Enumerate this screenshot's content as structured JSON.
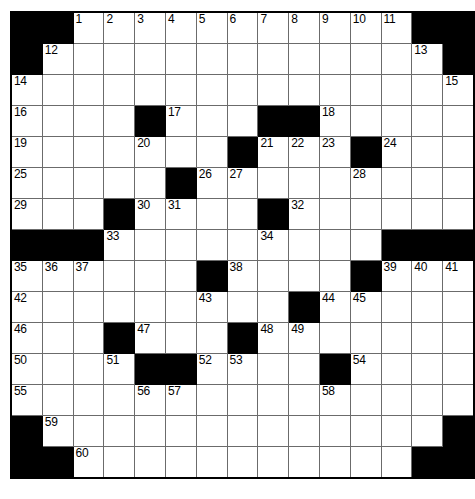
{
  "puzzle": {
    "title": "",
    "rows": 15,
    "cols": 15,
    "cell_size_px": 30,
    "colors": {
      "block": "#000000",
      "cell": "#ffffff",
      "grid_line": "#6b6b6b",
      "border": "#000000",
      "number_text": "#000000"
    },
    "grid": [
      [
        {
          "type": "block"
        },
        {
          "type": "block"
        },
        {
          "type": "cell",
          "number": "1"
        },
        {
          "type": "cell",
          "number": "2"
        },
        {
          "type": "cell",
          "number": "3"
        },
        {
          "type": "cell",
          "number": "4"
        },
        {
          "type": "cell",
          "number": "5"
        },
        {
          "type": "cell",
          "number": "6"
        },
        {
          "type": "cell",
          "number": "7"
        },
        {
          "type": "cell",
          "number": "8"
        },
        {
          "type": "cell",
          "number": "9"
        },
        {
          "type": "cell",
          "number": "10"
        },
        {
          "type": "cell",
          "number": "11"
        },
        {
          "type": "block"
        },
        {
          "type": "block"
        }
      ],
      [
        {
          "type": "block"
        },
        {
          "type": "cell",
          "number": "12"
        },
        {
          "type": "cell",
          "number": ""
        },
        {
          "type": "cell",
          "number": ""
        },
        {
          "type": "cell",
          "number": ""
        },
        {
          "type": "cell",
          "number": ""
        },
        {
          "type": "cell",
          "number": ""
        },
        {
          "type": "cell",
          "number": ""
        },
        {
          "type": "cell",
          "number": ""
        },
        {
          "type": "cell",
          "number": ""
        },
        {
          "type": "cell",
          "number": ""
        },
        {
          "type": "cell",
          "number": ""
        },
        {
          "type": "cell",
          "number": ""
        },
        {
          "type": "cell",
          "number": "13"
        },
        {
          "type": "block"
        }
      ],
      [
        {
          "type": "cell",
          "number": "14"
        },
        {
          "type": "cell",
          "number": ""
        },
        {
          "type": "cell",
          "number": ""
        },
        {
          "type": "cell",
          "number": ""
        },
        {
          "type": "cell",
          "number": ""
        },
        {
          "type": "cell",
          "number": ""
        },
        {
          "type": "cell",
          "number": ""
        },
        {
          "type": "cell",
          "number": ""
        },
        {
          "type": "cell",
          "number": ""
        },
        {
          "type": "cell",
          "number": ""
        },
        {
          "type": "cell",
          "number": ""
        },
        {
          "type": "cell",
          "number": ""
        },
        {
          "type": "cell",
          "number": ""
        },
        {
          "type": "cell",
          "number": ""
        },
        {
          "type": "cell",
          "number": "15"
        }
      ],
      [
        {
          "type": "cell",
          "number": "16"
        },
        {
          "type": "cell",
          "number": ""
        },
        {
          "type": "cell",
          "number": ""
        },
        {
          "type": "cell",
          "number": ""
        },
        {
          "type": "block"
        },
        {
          "type": "cell",
          "number": "17"
        },
        {
          "type": "cell",
          "number": ""
        },
        {
          "type": "cell",
          "number": ""
        },
        {
          "type": "block"
        },
        {
          "type": "block"
        },
        {
          "type": "cell",
          "number": "18"
        },
        {
          "type": "cell",
          "number": ""
        },
        {
          "type": "cell",
          "number": ""
        },
        {
          "type": "cell",
          "number": ""
        },
        {
          "type": "cell",
          "number": ""
        }
      ],
      [
        {
          "type": "cell",
          "number": "19"
        },
        {
          "type": "cell",
          "number": ""
        },
        {
          "type": "cell",
          "number": ""
        },
        {
          "type": "cell",
          "number": ""
        },
        {
          "type": "cell",
          "number": "20"
        },
        {
          "type": "cell",
          "number": ""
        },
        {
          "type": "cell",
          "number": ""
        },
        {
          "type": "block"
        },
        {
          "type": "cell",
          "number": "21"
        },
        {
          "type": "cell",
          "number": "22"
        },
        {
          "type": "cell",
          "number": "23"
        },
        {
          "type": "block"
        },
        {
          "type": "cell",
          "number": "24"
        },
        {
          "type": "cell",
          "number": ""
        },
        {
          "type": "cell",
          "number": ""
        }
      ],
      [
        {
          "type": "cell",
          "number": "25"
        },
        {
          "type": "cell",
          "number": ""
        },
        {
          "type": "cell",
          "number": ""
        },
        {
          "type": "cell",
          "number": ""
        },
        {
          "type": "cell",
          "number": ""
        },
        {
          "type": "block"
        },
        {
          "type": "cell",
          "number": "26"
        },
        {
          "type": "cell",
          "number": "27"
        },
        {
          "type": "cell",
          "number": ""
        },
        {
          "type": "cell",
          "number": ""
        },
        {
          "type": "cell",
          "number": ""
        },
        {
          "type": "cell",
          "number": "28"
        },
        {
          "type": "cell",
          "number": ""
        },
        {
          "type": "cell",
          "number": ""
        },
        {
          "type": "cell",
          "number": ""
        }
      ],
      [
        {
          "type": "cell",
          "number": "29"
        },
        {
          "type": "cell",
          "number": ""
        },
        {
          "type": "cell",
          "number": ""
        },
        {
          "type": "block"
        },
        {
          "type": "cell",
          "number": "30"
        },
        {
          "type": "cell",
          "number": "31"
        },
        {
          "type": "cell",
          "number": ""
        },
        {
          "type": "cell",
          "number": ""
        },
        {
          "type": "block"
        },
        {
          "type": "cell",
          "number": "32"
        },
        {
          "type": "cell",
          "number": ""
        },
        {
          "type": "cell",
          "number": ""
        },
        {
          "type": "cell",
          "number": ""
        },
        {
          "type": "cell",
          "number": ""
        },
        {
          "type": "cell",
          "number": ""
        }
      ],
      [
        {
          "type": "block"
        },
        {
          "type": "block"
        },
        {
          "type": "block"
        },
        {
          "type": "cell",
          "number": "33"
        },
        {
          "type": "cell",
          "number": ""
        },
        {
          "type": "cell",
          "number": ""
        },
        {
          "type": "cell",
          "number": ""
        },
        {
          "type": "cell",
          "number": ""
        },
        {
          "type": "cell",
          "number": "34"
        },
        {
          "type": "cell",
          "number": ""
        },
        {
          "type": "cell",
          "number": ""
        },
        {
          "type": "cell",
          "number": ""
        },
        {
          "type": "block"
        },
        {
          "type": "block"
        },
        {
          "type": "block"
        }
      ],
      [
        {
          "type": "cell",
          "number": "35"
        },
        {
          "type": "cell",
          "number": "36"
        },
        {
          "type": "cell",
          "number": "37"
        },
        {
          "type": "cell",
          "number": ""
        },
        {
          "type": "cell",
          "number": ""
        },
        {
          "type": "cell",
          "number": ""
        },
        {
          "type": "block"
        },
        {
          "type": "cell",
          "number": "38"
        },
        {
          "type": "cell",
          "number": ""
        },
        {
          "type": "cell",
          "number": ""
        },
        {
          "type": "cell",
          "number": ""
        },
        {
          "type": "block"
        },
        {
          "type": "cell",
          "number": "39"
        },
        {
          "type": "cell",
          "number": "40"
        },
        {
          "type": "cell",
          "number": "41"
        }
      ],
      [
        {
          "type": "cell",
          "number": "42"
        },
        {
          "type": "cell",
          "number": ""
        },
        {
          "type": "cell",
          "number": ""
        },
        {
          "type": "cell",
          "number": ""
        },
        {
          "type": "cell",
          "number": ""
        },
        {
          "type": "cell",
          "number": ""
        },
        {
          "type": "cell",
          "number": "43"
        },
        {
          "type": "cell",
          "number": ""
        },
        {
          "type": "cell",
          "number": ""
        },
        {
          "type": "block"
        },
        {
          "type": "cell",
          "number": "44"
        },
        {
          "type": "cell",
          "number": "45"
        },
        {
          "type": "cell",
          "number": ""
        },
        {
          "type": "cell",
          "number": ""
        },
        {
          "type": "cell",
          "number": ""
        }
      ],
      [
        {
          "type": "cell",
          "number": "46"
        },
        {
          "type": "cell",
          "number": ""
        },
        {
          "type": "cell",
          "number": ""
        },
        {
          "type": "block"
        },
        {
          "type": "cell",
          "number": "47"
        },
        {
          "type": "cell",
          "number": ""
        },
        {
          "type": "cell",
          "number": ""
        },
        {
          "type": "block"
        },
        {
          "type": "cell",
          "number": "48"
        },
        {
          "type": "cell",
          "number": "49"
        },
        {
          "type": "cell",
          "number": ""
        },
        {
          "type": "cell",
          "number": ""
        },
        {
          "type": "cell",
          "number": ""
        },
        {
          "type": "cell",
          "number": ""
        },
        {
          "type": "cell",
          "number": ""
        }
      ],
      [
        {
          "type": "cell",
          "number": "50"
        },
        {
          "type": "cell",
          "number": ""
        },
        {
          "type": "cell",
          "number": ""
        },
        {
          "type": "cell",
          "number": "51"
        },
        {
          "type": "block"
        },
        {
          "type": "block"
        },
        {
          "type": "cell",
          "number": "52"
        },
        {
          "type": "cell",
          "number": "53"
        },
        {
          "type": "cell",
          "number": ""
        },
        {
          "type": "cell",
          "number": ""
        },
        {
          "type": "block"
        },
        {
          "type": "cell",
          "number": "54"
        },
        {
          "type": "cell",
          "number": ""
        },
        {
          "type": "cell",
          "number": ""
        },
        {
          "type": "cell",
          "number": ""
        }
      ],
      [
        {
          "type": "cell",
          "number": "55"
        },
        {
          "type": "cell",
          "number": ""
        },
        {
          "type": "cell",
          "number": ""
        },
        {
          "type": "cell",
          "number": ""
        },
        {
          "type": "cell",
          "number": "56"
        },
        {
          "type": "cell",
          "number": "57"
        },
        {
          "type": "cell",
          "number": ""
        },
        {
          "type": "cell",
          "number": ""
        },
        {
          "type": "cell",
          "number": ""
        },
        {
          "type": "cell",
          "number": ""
        },
        {
          "type": "cell",
          "number": "58"
        },
        {
          "type": "cell",
          "number": ""
        },
        {
          "type": "cell",
          "number": ""
        },
        {
          "type": "cell",
          "number": ""
        },
        {
          "type": "cell",
          "number": ""
        }
      ],
      [
        {
          "type": "block"
        },
        {
          "type": "cell",
          "number": "59"
        },
        {
          "type": "cell",
          "number": ""
        },
        {
          "type": "cell",
          "number": ""
        },
        {
          "type": "cell",
          "number": ""
        },
        {
          "type": "cell",
          "number": ""
        },
        {
          "type": "cell",
          "number": ""
        },
        {
          "type": "cell",
          "number": ""
        },
        {
          "type": "cell",
          "number": ""
        },
        {
          "type": "cell",
          "number": ""
        },
        {
          "type": "cell",
          "number": ""
        },
        {
          "type": "cell",
          "number": ""
        },
        {
          "type": "cell",
          "number": ""
        },
        {
          "type": "cell",
          "number": ""
        },
        {
          "type": "block"
        }
      ],
      [
        {
          "type": "block"
        },
        {
          "type": "block"
        },
        {
          "type": "cell",
          "number": "60"
        },
        {
          "type": "cell",
          "number": ""
        },
        {
          "type": "cell",
          "number": ""
        },
        {
          "type": "cell",
          "number": ""
        },
        {
          "type": "cell",
          "number": ""
        },
        {
          "type": "cell",
          "number": ""
        },
        {
          "type": "cell",
          "number": ""
        },
        {
          "type": "cell",
          "number": ""
        },
        {
          "type": "cell",
          "number": ""
        },
        {
          "type": "cell",
          "number": ""
        },
        {
          "type": "cell",
          "number": ""
        },
        {
          "type": "block"
        },
        {
          "type": "block"
        }
      ]
    ]
  }
}
